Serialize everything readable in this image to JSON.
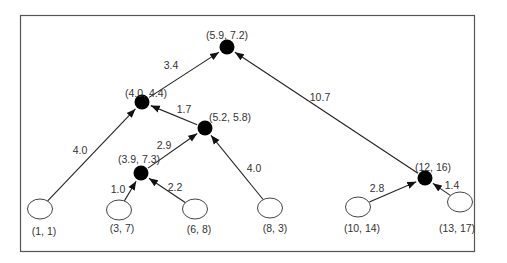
{
  "diagram": {
    "type": "hierarchical-clustering-tree",
    "colors": {
      "frame": "#555555",
      "edge": "#222222",
      "internal_node": "#000000",
      "leaf_fill": "#ffffff",
      "leaf_stroke": "#444444",
      "text": "#333333"
    },
    "nodes": [
      {
        "id": "root",
        "label": "(5.9, 7.2)",
        "kind": "internal",
        "x": 227,
        "y": 47,
        "lx": 227,
        "ly": 36
      },
      {
        "id": "n44",
        "label": "(4.0, 4.4)",
        "kind": "internal",
        "x": 142,
        "y": 102,
        "lx": 146,
        "ly": 94
      },
      {
        "id": "n58",
        "label": "(5.2, 5.8)",
        "kind": "internal",
        "x": 205,
        "y": 128,
        "lx": 230,
        "ly": 118
      },
      {
        "id": "n73",
        "label": "(3.9, 7.3)",
        "kind": "internal",
        "x": 141,
        "y": 173,
        "lx": 139,
        "ly": 160
      },
      {
        "id": "n1216",
        "label": "(12, 16)",
        "kind": "internal",
        "x": 425,
        "y": 178,
        "lx": 433,
        "ly": 168
      },
      {
        "id": "l11",
        "label": "(1, 1)",
        "kind": "leaf",
        "x": 40,
        "y": 209,
        "lx": 44,
        "ly": 232
      },
      {
        "id": "l37",
        "label": "(3, 7)",
        "kind": "leaf",
        "x": 119,
        "y": 210,
        "lx": 122,
        "ly": 229
      },
      {
        "id": "l68",
        "label": "(6, 8)",
        "kind": "leaf",
        "x": 195,
        "y": 209,
        "lx": 199,
        "ly": 230
      },
      {
        "id": "l83",
        "label": "(8, 3)",
        "kind": "leaf",
        "x": 270,
        "y": 208,
        "lx": 275,
        "ly": 229
      },
      {
        "id": "l1014",
        "label": "(10, 14)",
        "kind": "leaf",
        "x": 358,
        "y": 207,
        "lx": 362,
        "ly": 229
      },
      {
        "id": "l1317",
        "label": "(13, 17)",
        "kind": "leaf",
        "x": 460,
        "y": 202,
        "lx": 457,
        "ly": 229
      }
    ],
    "edges": [
      {
        "from": "n44",
        "to": "root",
        "weight": "3.4",
        "wx": 171,
        "wy": 66
      },
      {
        "from": "n1216",
        "to": "root",
        "weight": "10.7",
        "wx": 320,
        "wy": 98
      },
      {
        "from": "l11",
        "to": "n44",
        "weight": "4.0",
        "wx": 80,
        "wy": 151
      },
      {
        "from": "n58",
        "to": "n44",
        "weight": "1.7",
        "wx": 184,
        "wy": 110
      },
      {
        "from": "n73",
        "to": "n58",
        "weight": "2.9",
        "wx": 164,
        "wy": 146
      },
      {
        "from": "l83",
        "to": "n58",
        "weight": "4.0",
        "wx": 254,
        "wy": 169
      },
      {
        "from": "l37",
        "to": "n73",
        "weight": "1.0",
        "wx": 118,
        "wy": 190
      },
      {
        "from": "l68",
        "to": "n73",
        "weight": "2.2",
        "wx": 175,
        "wy": 188
      },
      {
        "from": "l1014",
        "to": "n1216",
        "weight": "2.8",
        "wx": 377,
        "wy": 189
      },
      {
        "from": "l1317",
        "to": "n1216",
        "weight": "1.4",
        "wx": 452,
        "wy": 186
      }
    ]
  }
}
